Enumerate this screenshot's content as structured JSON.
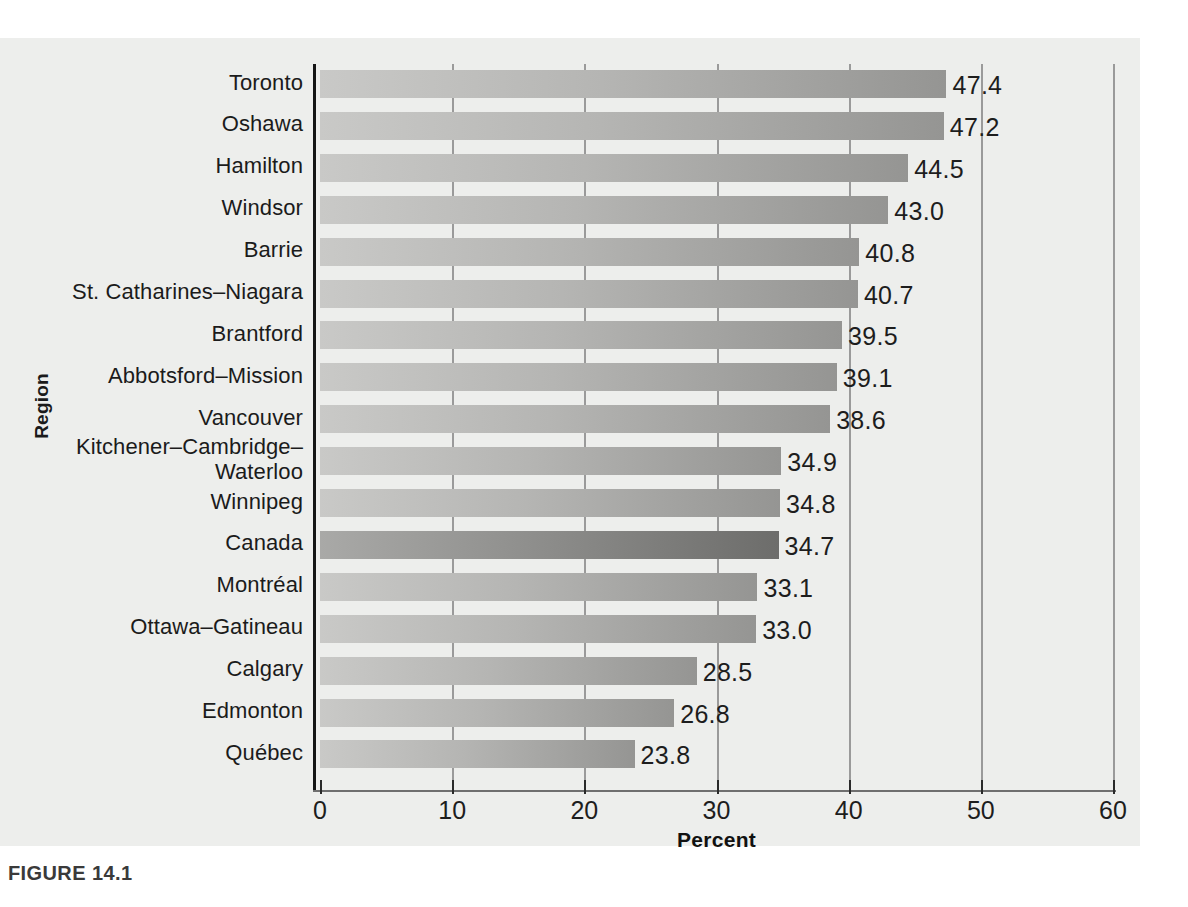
{
  "figure": {
    "caption": "FIGURE 14.1"
  },
  "chart_data": {
    "type": "bar",
    "orientation": "horizontal",
    "title": "",
    "xlabel": "Percent",
    "ylabel": "Region",
    "xlim": [
      0,
      60
    ],
    "xticks": [
      "0",
      "10",
      "20",
      "30",
      "40",
      "50",
      "60"
    ],
    "grid": "vertical",
    "legend": "none",
    "highlight_category": "Canada",
    "categories": [
      "Toronto",
      "Oshawa",
      "Hamilton",
      "Windsor",
      "Barrie",
      "St. Catharines–Niagara",
      "Brantford",
      "Abbotsford–Mission",
      "Vancouver",
      "Kitchener–Cambridge–\nWaterloo",
      "Winnipeg",
      "Canada",
      "Montréal",
      "Ottawa–Gatineau",
      "Calgary",
      "Edmonton",
      "Québec"
    ],
    "values": [
      47.4,
      47.2,
      44.5,
      43.0,
      40.8,
      40.7,
      39.5,
      39.1,
      38.6,
      34.9,
      34.8,
      34.7,
      33.1,
      33.0,
      28.5,
      26.8,
      23.8
    ],
    "value_labels": [
      "47.4",
      "47.2",
      "44.5",
      "43.0",
      "40.8",
      "40.7",
      "39.5",
      "39.1",
      "38.6",
      "34.9",
      "34.8",
      "34.7",
      "33.1",
      "33.0",
      "28.5",
      "26.8",
      "23.8"
    ],
    "colors": {
      "bar_light": "#c9c9c7",
      "bar_dark": "#959593",
      "bar_highlight_light": "#a9a9a7",
      "bar_highlight_dark": "#6d6d6b",
      "axis": "#151515",
      "gridline": "#9a9a9a",
      "page": "#edeeec",
      "text": "#1b1b1b"
    }
  }
}
